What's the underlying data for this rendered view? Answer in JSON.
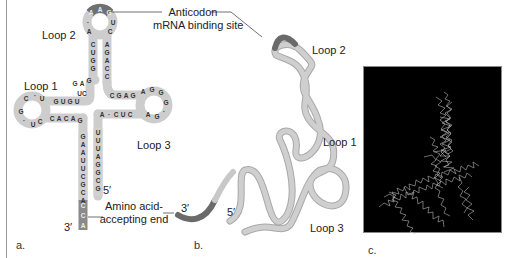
{
  "figure": {
    "panels": [
      {
        "letter": "a.",
        "description": "tRNA cloverleaf secondary structure"
      },
      {
        "letter": "b.",
        "description": "tRNA 3D folding tube model"
      },
      {
        "letter": "c.",
        "description": "tRNA molecular model (space-filling wireframe)"
      }
    ]
  },
  "panel_a": {
    "loop2_label": "Loop 2",
    "loop1_label": "Loop 1",
    "loop3_label": "Loop 3",
    "anticodon_line1": "Anticodon",
    "anticodon_line2": "mRNA binding site",
    "amino_line1": "Amino acid-",
    "amino_line2": "accepting end",
    "five_prime": "5′",
    "three_prime": "3′",
    "anticodon_bases": [
      "A",
      "A",
      "G"
    ],
    "acceptor_left_stem": [
      "G",
      "A",
      "A",
      "U",
      "U",
      "C",
      "G",
      "C",
      "A",
      "C",
      "C",
      "A"
    ],
    "acceptor_right_stem": [
      "U",
      "U",
      "U",
      "A",
      "G",
      "G",
      "C",
      "G"
    ],
    "anticodon_left_stem": [
      "C",
      "U",
      "G",
      "G"
    ],
    "anticodon_right_stem": [
      "A",
      "G",
      "A",
      "C",
      "C"
    ],
    "loop1_top": [
      "G",
      "U",
      "G",
      "U"
    ],
    "loop1_bottom": [
      "C",
      "A",
      "C",
      "A",
      "G"
    ],
    "loop3_top": [
      "C",
      "G",
      "A",
      "G"
    ],
    "loop3_bottom": [
      "A",
      "C",
      "U",
      "C"
    ],
    "colors": {
      "backbone": "#c9c9c9",
      "highlight": "#6e6e6e",
      "acceptor_dark": "#8a8a8a"
    }
  },
  "panel_b": {
    "loop2_label": "Loop 2",
    "loop1_label": "Loop 1",
    "loop3_label": "Loop 3",
    "three_prime": "3′",
    "five_prime": "5′",
    "colors": {
      "tube": "#c4c4c4",
      "tube_edge": "#a9a9a9",
      "highlight": "#6a6a6a"
    }
  },
  "panel_c": {
    "background": "#000000",
    "strand_color": "#d8d8d8"
  }
}
